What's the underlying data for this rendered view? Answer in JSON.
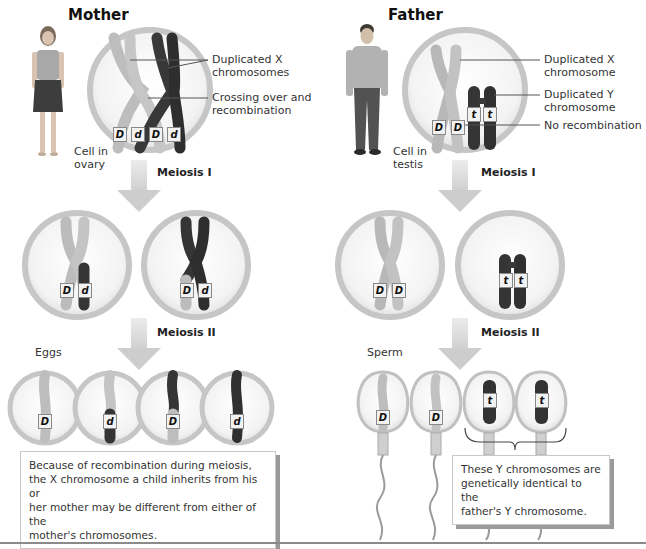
{
  "mother": {
    "heading": "Mother",
    "cell_label_line1": "Cell in",
    "cell_label_line2": "ovary",
    "callout_1_line1": "Duplicated X",
    "callout_1_line2": "chromosomes",
    "callout_2_line1": "Crossing over and",
    "callout_2_line2": "recombination",
    "meiosis_1": "Meiosis I",
    "meiosis_2": "Meiosis II",
    "gametes_label": "Eggs",
    "alleles_parent": [
      "D",
      "d",
      "D",
      "d"
    ],
    "alleles_meiosis1": [
      [
        "D",
        "d"
      ],
      [
        "D",
        "d"
      ]
    ],
    "alleles_gametes": [
      "D",
      "d",
      "D",
      "d"
    ],
    "caption": [
      "Because of recombination during meiosis,",
      "the X chromosome a child inherits from his or",
      "her mother may be different from either of the",
      "mother's chromosomes."
    ]
  },
  "father": {
    "heading": "Father",
    "cell_label_line1": "Cell in",
    "cell_label_line2": "testis",
    "callout_1_line1": "Duplicated X",
    "callout_1_line2": "chromosome",
    "callout_2_line1": "Duplicated Y",
    "callout_2_line2": "chromosome",
    "callout_3": "No recombination",
    "meiosis_1": "Meiosis I",
    "meiosis_2": "Meiosis II",
    "gametes_label": "Sperm",
    "alleles_parent": [
      "D",
      "D",
      "t",
      "t"
    ],
    "alleles_meiosis1": [
      [
        "D",
        "D"
      ],
      [
        "t",
        "t"
      ]
    ],
    "alleles_gametes": [
      "D",
      "D",
      "t",
      "t"
    ],
    "caption": [
      "These Y chromosomes are",
      "genetically identical to the",
      "father's Y chromosome."
    ]
  },
  "colors": {
    "light_chromosome": "#bdbdbd",
    "dark_chromosome": "#3a3a3a",
    "cell_ring": "#c9c9c9",
    "arrow": "#d0d0d0"
  }
}
